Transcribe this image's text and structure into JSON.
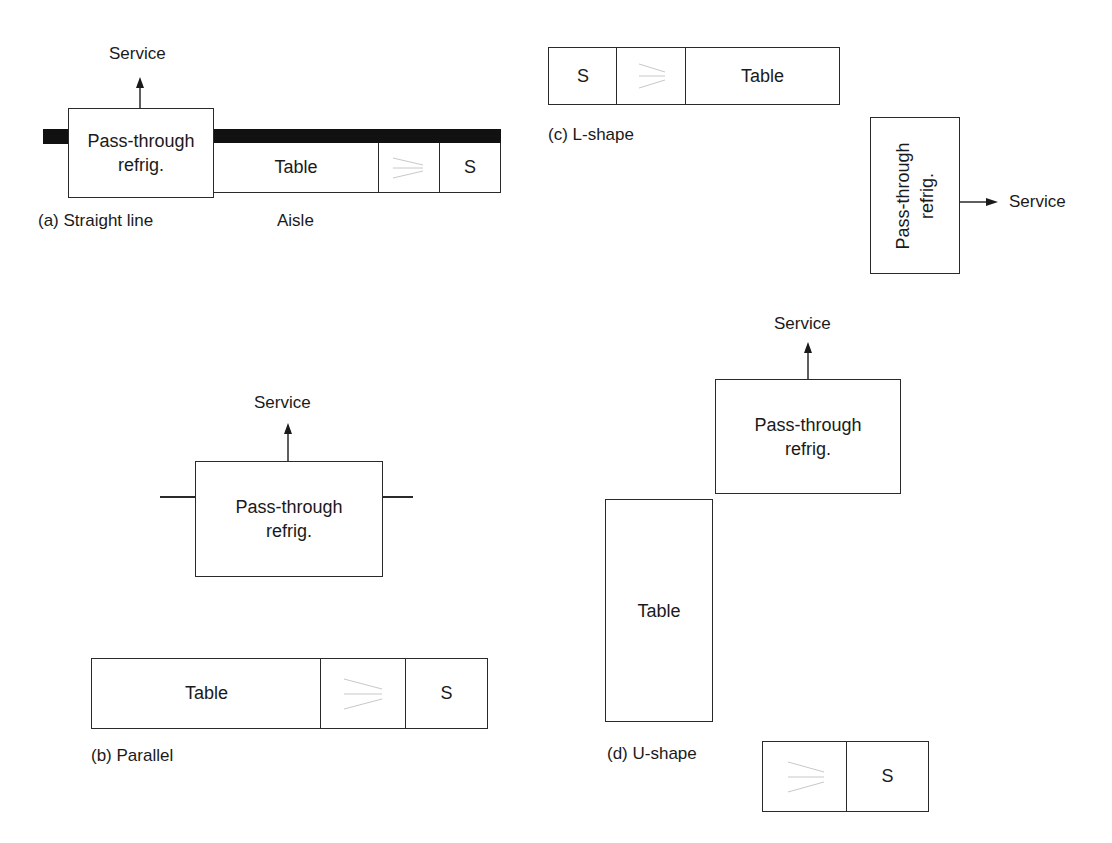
{
  "figure": {
    "stroke_color": "#2a2a2a",
    "wall_color": "#111111",
    "dish_rack_line_color": "#c8c8c8"
  },
  "layouts": {
    "a": {
      "caption": "(a) Straight line",
      "aisle_label": "Aisle",
      "service_label": "Service",
      "refrig_label_line1": "Pass-through",
      "refrig_label_line2": "refrig.",
      "table_label": "Table",
      "sink_label": "S"
    },
    "b": {
      "caption": "(b) Parallel",
      "service_label": "Service",
      "refrig_label_line1": "Pass-through",
      "refrig_label_line2": "refrig.",
      "table_label": "Table",
      "sink_label": "S"
    },
    "c": {
      "caption": "(c) L-shape",
      "service_label": "Service",
      "refrig_label_line1": "Pass-through",
      "refrig_label_line2": "refrig.",
      "table_label": "Table",
      "sink_label": "S"
    },
    "d": {
      "caption": "(d) U-shape",
      "service_label": "Service",
      "refrig_label_line1": "Pass-through",
      "refrig_label_line2": "refrig.",
      "table_label": "Table",
      "sink_label": "S"
    }
  }
}
